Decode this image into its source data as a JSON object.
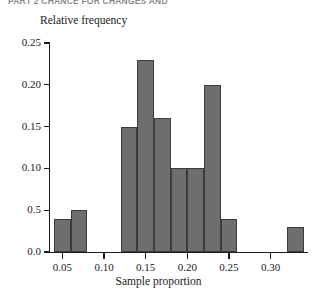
{
  "running_header": {
    "text": "PART 2 CHANCE FOR CHANGES AND"
  },
  "chart_data": {
    "type": "bar",
    "title": "",
    "subtitle": "",
    "xlabel": "Sample proportion",
    "ylabel": "Relative frequency",
    "grid": false,
    "legend": null,
    "xlim": [
      0.035,
      0.345
    ],
    "ylim": [
      0.0,
      0.25
    ],
    "bin_width": 0.02,
    "x_ticks": [
      0.05,
      0.1,
      0.15,
      0.2,
      0.25,
      0.3
    ],
    "x_tick_labels": [
      "0.05",
      "0.10",
      "0.15",
      "0.20",
      "0.25",
      "0.30"
    ],
    "y_ticks": [
      0.0,
      0.05,
      0.1,
      0.15,
      0.2,
      0.25
    ],
    "y_tick_labels": [
      "0.0",
      "0.5",
      "0.10",
      "0.15",
      "0.20",
      "0.25"
    ],
    "categories": [
      "0.04-0.06",
      "0.06-0.08",
      "0.12-0.14",
      "0.14-0.16",
      "0.16-0.18",
      "0.18-0.20",
      "0.20-0.22",
      "0.22-0.24",
      "0.24-0.26",
      "0.32-0.34"
    ],
    "bins": [
      {
        "start": 0.04,
        "end": 0.06,
        "value": 0.04
      },
      {
        "start": 0.06,
        "end": 0.08,
        "value": 0.05
      },
      {
        "start": 0.12,
        "end": 0.14,
        "value": 0.15
      },
      {
        "start": 0.14,
        "end": 0.16,
        "value": 0.23
      },
      {
        "start": 0.16,
        "end": 0.18,
        "value": 0.16
      },
      {
        "start": 0.18,
        "end": 0.2,
        "value": 0.1
      },
      {
        "start": 0.2,
        "end": 0.22,
        "value": 0.1
      },
      {
        "start": 0.22,
        "end": 0.24,
        "value": 0.2
      },
      {
        "start": 0.24,
        "end": 0.26,
        "value": 0.04
      },
      {
        "start": 0.32,
        "end": 0.34,
        "value": 0.03
      }
    ],
    "values": [
      0.04,
      0.05,
      0.15,
      0.23,
      0.16,
      0.1,
      0.1,
      0.2,
      0.04,
      0.03
    ],
    "colors": {
      "bar_fill": "#6e6e6e",
      "bar_stroke": "#3d3d3d",
      "axis": "#1a1a1a",
      "background": "#ffffff"
    }
  }
}
